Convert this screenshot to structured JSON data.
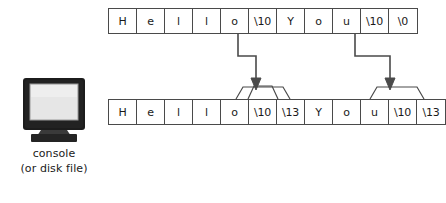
{
  "diagram": {
    "colors": {
      "stroke": "#4a4a4a",
      "text": "#1a1a1a",
      "background": "#ffffff",
      "monitor_bezel": "#1c1c1c",
      "monitor_screen": "#e3e3e3",
      "monitor_base": "#2b2b2b"
    },
    "console": {
      "icon": "crt-monitor-icon",
      "caption_line_1": "console",
      "caption_line_2": "(or disk file)"
    },
    "memory_row": {
      "label": "memory byte sequence",
      "cells": [
        "H",
        "e",
        "l",
        "l",
        "o",
        "\\10",
        "Y",
        "o",
        "u",
        "\\10",
        "\\0"
      ]
    },
    "file_row": {
      "label": "console or disk file byte sequence",
      "cells": [
        "H",
        "e",
        "l",
        "l",
        "o",
        "\\10",
        "\\13",
        "Y",
        "o",
        "u",
        "\\10",
        "\\13"
      ]
    },
    "connectors": [
      {
        "name": "newline-expansion-1",
        "from_cell_index": 5,
        "from_cell_value": "\\10",
        "to_cell_indices": [
          5,
          6
        ],
        "to_cell_values": [
          "\\10",
          "\\13"
        ],
        "arrow": "down-arrow-icon"
      },
      {
        "name": "newline-expansion-2",
        "from_cell_index": 9,
        "from_cell_value": "\\10",
        "to_cell_indices": [
          10,
          11
        ],
        "to_cell_values": [
          "\\10",
          "\\13"
        ],
        "arrow": "down-arrow-icon"
      }
    ]
  }
}
